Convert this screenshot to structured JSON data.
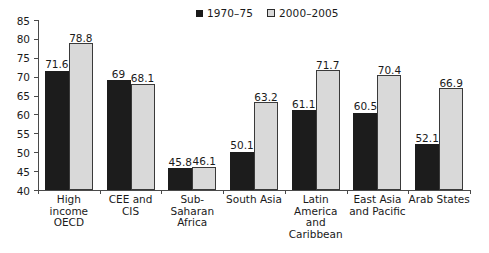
{
  "chart_data": {
    "type": "bar",
    "title": "",
    "subtitle": "",
    "xlabel": "",
    "ylabel": "",
    "ylim": [
      40,
      85
    ],
    "ytick_step": 5,
    "yticks": [
      40,
      45,
      50,
      55,
      60,
      65,
      70,
      75,
      80,
      85
    ],
    "grid": false,
    "legend_position": "top-right",
    "categories": [
      "High income\nOECD",
      "CEE and\nCIS",
      "Sub-\nSaharan\nAfrica",
      "South Asia",
      "Latin\nAmerica and\nCaribbean",
      "East Asia\nand Pacific",
      "Arab States"
    ],
    "series": [
      {
        "name": "1970–75",
        "color": "#1c1c1c",
        "values": [
          71.6,
          69,
          45.8,
          50.1,
          61.1,
          60.5,
          52.1
        ],
        "labels": [
          "71.6",
          "69",
          "45.8",
          "50.1",
          "61.1",
          "60.5",
          "52.1"
        ]
      },
      {
        "name": "2000–2005",
        "color": "#d9d9d9",
        "values": [
          78.8,
          68.1,
          46.1,
          63.2,
          71.7,
          70.4,
          66.9
        ],
        "labels": [
          "78.8",
          "68.1",
          "46.1",
          "63.2",
          "71.7",
          "70.4",
          "66.9"
        ]
      }
    ]
  },
  "legend": {
    "entries": [
      {
        "label": "1970–75"
      },
      {
        "label": "2000–2005"
      }
    ]
  },
  "colors": {
    "series_a": "#1c1c1c",
    "series_b": "#d9d9d9",
    "axis": "#4a4a4a",
    "text": "#1a1a1a",
    "background": "#ffffff"
  }
}
